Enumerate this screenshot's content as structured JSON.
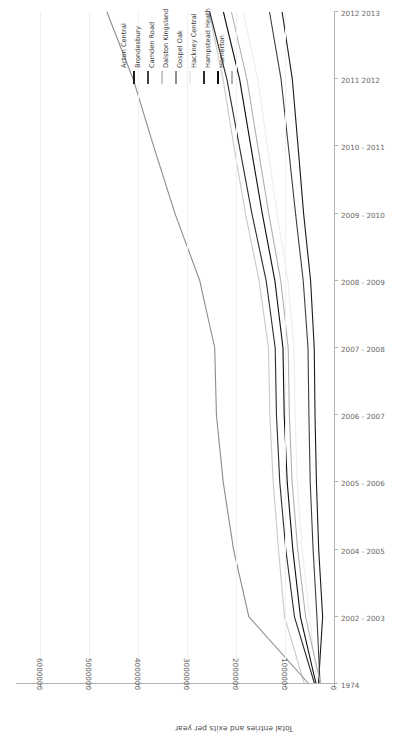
{
  "chart_data": {
    "type": "line",
    "title": "",
    "xlabel": "",
    "ylabel": "Total entries and exits per year",
    "ylim": [
      0,
      6500000
    ],
    "yticks": [
      0,
      1000000,
      2000000,
      3000000,
      4000000,
      5000000,
      6000000
    ],
    "ytick_labels": [
      "0",
      "1000000",
      "2000000",
      "3000000",
      "4000000",
      "5000000",
      "6000000"
    ],
    "grid": true,
    "legend_position": "top",
    "categories": [
      "1974",
      "2002 - 2003",
      "2004 - 2005",
      "2005 - 2006",
      "2006 - 2007",
      "2007 - 2008",
      "2008 - 2009",
      "2009 - 2010",
      "2010 - 2011",
      "2011 2012",
      "2012 2013"
    ],
    "series": [
      {
        "name": "Acton Central",
        "color": "#1a1a1a",
        "values": [
          318000,
          232000,
          313000,
          359000,
          388000,
          404000,
          478000,
          621000,
          735000,
          852000,
          1060000
        ]
      },
      {
        "name": "Brondesbury",
        "color": "#3f3f3f",
        "values": [
          286000,
          349000,
          427000,
          486000,
          513000,
          531000,
          629000,
          786000,
          933000,
          1082000,
          1318000
        ]
      },
      {
        "name": "Camden Road",
        "color": "#c9c9c9",
        "values": [
          604000,
          1012000,
          1134000,
          1243000,
          1311000,
          1340000,
          1530000,
          1810000,
          2046000,
          2268000,
          2554000
        ]
      },
      {
        "name": "Dalston Kingsland",
        "color": "#8c8c8c",
        "values": [
          512000,
          1740000,
          2053000,
          2264000,
          2403000,
          2438000,
          2743000,
          3250000,
          3686000,
          4104000,
          4642000
        ]
      },
      {
        "name": "Gospel Oak",
        "color": "#ededed",
        "values": [
          342000,
          497000,
          652000,
          751000,
          796000,
          817000,
          944000,
          1162000,
          1364000,
          1558000,
          1856000
        ]
      },
      {
        "name": "Hackney Central",
        "color": "#2b2b2b",
        "values": [
          396000,
          808000,
          985000,
          1108000,
          1176000,
          1202000,
          1386000,
          1678000,
          1934000,
          2190000,
          2540000
        ]
      },
      {
        "name": "Hampstead Heath",
        "color": "#0d0d0d",
        "values": [
          366000,
          686000,
          842000,
          956000,
          1018000,
          1043000,
          1208000,
          1466000,
          1700000,
          1930000,
          2260000
        ]
      },
      {
        "name": "Homerton",
        "color": "#b0b0b0",
        "values": [
          274000,
          580000,
          742000,
          856000,
          912000,
          936000,
          1088000,
          1334000,
          1558000,
          1780000,
          2096000
        ]
      }
    ]
  },
  "legend": {
    "items": [
      {
        "label": "Acton Central",
        "color": "#1a1a1a"
      },
      {
        "label": "Brondesbury",
        "color": "#3f3f3f"
      },
      {
        "label": "Camden Road",
        "color": "#c9c9c9"
      },
      {
        "label": "Dalston Kingsland",
        "color": "#8c8c8c"
      },
      {
        "label": "Gospel Oak",
        "color": "#ededed"
      },
      {
        "label": "Hackney Central",
        "color": "#2b2b2b"
      },
      {
        "label": "Hampstead Heath",
        "color": "#0d0d0d"
      },
      {
        "label": "Homerton",
        "color": "#b0b0b0"
      }
    ]
  }
}
